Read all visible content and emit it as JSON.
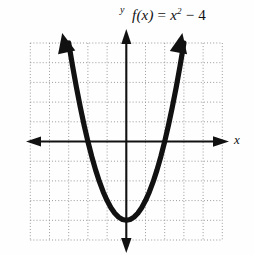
{
  "figure": {
    "kind": "coordinate-plane-parabola-graph",
    "background_color": "#fefefe",
    "ink_color": "#111111",
    "grid_color": "#9a9a9a",
    "function_label": {
      "prefix": "f",
      "argument": "(x)",
      "equals": " = ",
      "base": "x",
      "exponent": "2",
      "tail": " − 4",
      "full_text": "f(x) = x² − 4"
    },
    "axis_labels": {
      "x": "x",
      "y": "y"
    }
  },
  "chart_data": {
    "type": "line",
    "xlabel": "x",
    "ylabel": "y",
    "grid": true,
    "grid_style": "dotted",
    "grid_step": 1,
    "legend_position": "none",
    "xlim": [
      -5,
      5
    ],
    "ylim": [
      -5,
      5
    ],
    "xticks": [
      -5,
      -4,
      -3,
      -2,
      -1,
      0,
      1,
      2,
      3,
      4,
      5
    ],
    "yticks": [
      -5,
      -4,
      -3,
      -2,
      -1,
      0,
      1,
      2,
      3,
      4,
      5
    ],
    "tick_labels_shown": false,
    "equation": "y = x^2 - 4",
    "vertex": [
      0,
      -4
    ],
    "roots": [
      -2,
      2
    ],
    "y_intercept": -4,
    "arrows": [
      "left-arm-up",
      "right-arm-up",
      "x-axis-both",
      "y-axis-both"
    ],
    "series": [
      {
        "name": "f(x) = x² − 4",
        "x": [
          -3.0,
          -2.8,
          -2.6,
          -2.4,
          -2.2,
          -2.0,
          -1.8,
          -1.6,
          -1.4,
          -1.2,
          -1.0,
          -0.8,
          -0.6,
          -0.4,
          -0.2,
          0.0,
          0.2,
          0.4,
          0.6,
          0.8,
          1.0,
          1.2,
          1.4,
          1.6,
          1.8,
          2.0,
          2.2,
          2.4,
          2.6,
          2.8,
          3.0
        ],
        "y": [
          5.0,
          3.84,
          2.76,
          1.76,
          0.84,
          0.0,
          -0.76,
          -1.44,
          -2.04,
          -2.56,
          -3.0,
          -3.36,
          -3.64,
          -3.84,
          -3.96,
          -4.0,
          -3.96,
          -3.84,
          -3.64,
          -3.36,
          -3.0,
          -2.56,
          -2.04,
          -1.44,
          -0.76,
          0.0,
          0.84,
          1.76,
          2.76,
          3.84,
          5.0
        ]
      }
    ]
  }
}
